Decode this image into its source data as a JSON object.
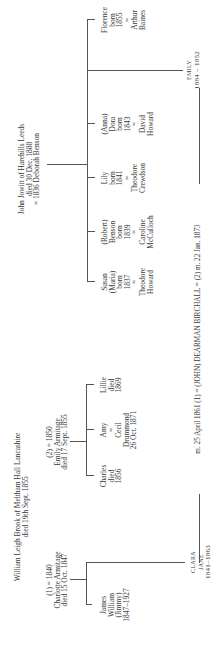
{
  "brook_family": {
    "head": [
      "William Leigh Brook of Meltham Hall Lancashire",
      "died 19th Sept. 1855"
    ],
    "marriage_1": [
      "(1) = 1840",
      "Charlotte Armitage",
      "died 15 Oct. 1847"
    ],
    "marriage_2": [
      "(2) = 1850",
      "Emily Armitage",
      "died 17 Sept. 1855"
    ],
    "children_1": [
      {
        "lines": [
          "James",
          "William",
          "(Jimmy)",
          "1847–1927"
        ]
      }
    ],
    "children_2": [
      {
        "lines": [
          "Charles",
          "died",
          "1856"
        ]
      },
      {
        "lines": [
          "Amy",
          "=",
          "Cecil",
          "Drummond",
          "26 Oct. 1871"
        ]
      },
      {
        "lines": [
          "Lillie",
          "died",
          "1869"
        ]
      }
    ],
    "clara": [
      "CLARA",
      "JANE",
      "1841–1863"
    ]
  },
  "jowitt_family": {
    "head": [
      "John Jowitt of Harehills Leeds",
      "died 30 Dec. 1888",
      "= 1836 Deborah Benson"
    ],
    "children": [
      {
        "lines": [
          "Susan",
          "(Maria)",
          "born",
          "1837",
          "=",
          "Theodore",
          "Howard"
        ]
      },
      {
        "lines": [
          "(Robert)",
          "Benson",
          "born",
          "1839",
          "=",
          "Caroline",
          "McCulloch"
        ]
      },
      {
        "lines": [
          "Lily",
          "born",
          "1841",
          "=",
          "Theodore",
          "Crewdson"
        ]
      },
      {
        "lines": [
          "(Anna)",
          "Dora",
          "born",
          "1843",
          "=",
          "David",
          "Howard"
        ]
      },
      {
        "lines": [
          "Florence",
          "born",
          "1855",
          "=",
          "Arthur",
          "Baines"
        ]
      }
    ],
    "emily": [
      "EMILY",
      "1884 – 1852"
    ]
  },
  "marriage_line": {
    "left": "m. 25 April 1861 (1) = (JOHN) DEARMAN BIRCHALL = (2) m. 22 Jan. 1873"
  }
}
